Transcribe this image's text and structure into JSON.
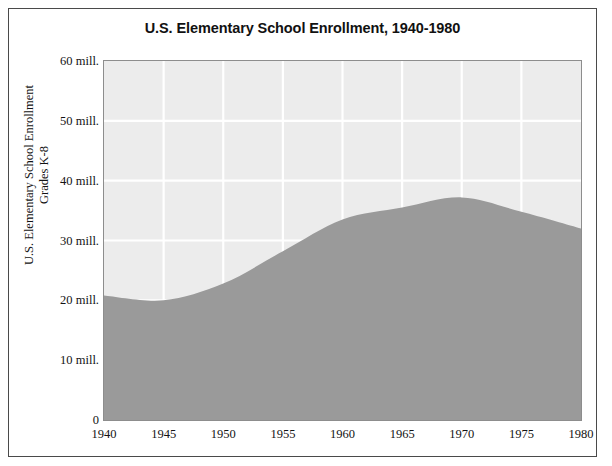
{
  "chart_data": {
    "type": "area",
    "title": "U.S. Elementary School Enrollment, 1940-1980",
    "xlabel": "",
    "ylabel": "U.S. Elementary School Enrollment",
    "ylabel_line2": "Grades K-8",
    "x": [
      1940,
      1945,
      1950,
      1955,
      1960,
      1965,
      1970,
      1975,
      1980
    ],
    "values": [
      20.8,
      20.0,
      22.8,
      28.2,
      33.5,
      35.5,
      37.2,
      34.8,
      32.0
    ],
    "series": [
      {
        "name": "U.S. Elementary School Enrollment Grades K-8",
        "values": [
          20.8,
          20.0,
          22.8,
          28.2,
          33.5,
          35.5,
          37.2,
          34.8,
          32.0
        ]
      }
    ],
    "xlim": [
      1940,
      1980
    ],
    "ylim": [
      0,
      60
    ],
    "xticks": [
      1940,
      1945,
      1950,
      1955,
      1960,
      1965,
      1970,
      1975,
      1980
    ],
    "xticklabels": [
      "1940",
      "1945",
      "1950",
      "1955",
      "1960",
      "1965",
      "1970",
      "1975",
      "1980"
    ],
    "yticks": [
      0,
      10,
      20,
      30,
      40,
      50,
      60
    ],
    "yticklabels": [
      "0",
      "10 mill.",
      "20 mill.",
      "30 mill.",
      "40 mill.",
      "50 mill.",
      "60 mill."
    ],
    "grid": true,
    "grid_color": "#ffffff",
    "legend": false,
    "legend_position": "none",
    "units": "millions",
    "colors": {
      "area_fill": "#9a9a9a",
      "plot_background": "#ececec",
      "gridline": "#ffffff",
      "plot_border": "#8d8d8d",
      "figure_border": "#4a4a4a",
      "text": "#131313",
      "figure_background": "#ffffff"
    }
  }
}
